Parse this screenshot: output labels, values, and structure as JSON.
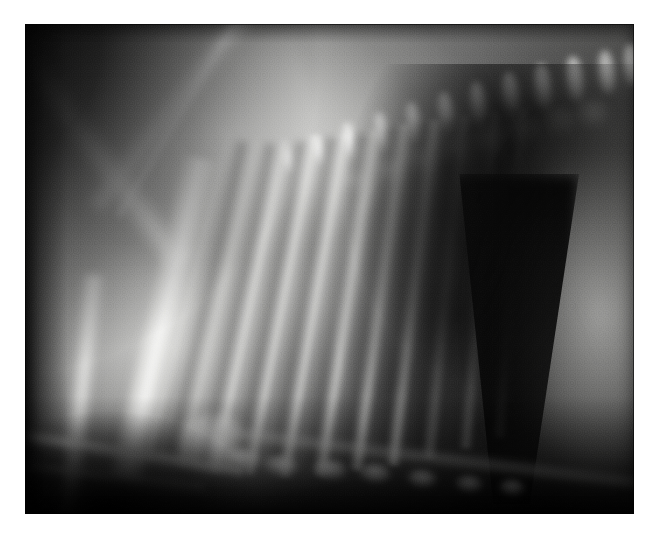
{
  "viewer": {
    "background_color": "#ffffff",
    "canvas_width": 657,
    "canvas_height": 540
  },
  "film": {
    "modality_label": "radiograph",
    "view_label": "lateral thoracic projection",
    "orientation_label": "cranial-left / dorsal-up",
    "plate_left": 25,
    "plate_top": 24,
    "plate_width": 609,
    "plate_height": 490,
    "border_color": "#ffffff",
    "film_base_color": "#0a0a0a",
    "bone_color": "#f6f6f4",
    "soft_tissue_color": "#a8a8a6",
    "gas_color": "#050505"
  },
  "anatomy": {
    "regions": [
      {
        "name": "cranial-thorax-soft-tissue",
        "density_label": "radiopaque",
        "note": "bright cranioventral mass, cranial-left"
      },
      {
        "name": "scapula",
        "density_label": "bone",
        "note": "oblique radiopaque band, cranio-dorsal"
      },
      {
        "name": "humerus",
        "density_label": "bone",
        "note": "long bright diaphysis sweeping caudoventrally"
      },
      {
        "name": "radius-ulna",
        "density_label": "bone",
        "note": "second long bone, ventro-cranial"
      },
      {
        "name": "thoracic-vertebrae",
        "density_label": "bone",
        "note": "oblique column rising caudo-dorsally"
      },
      {
        "name": "spinous-processes",
        "density_label": "bone",
        "note": "row of rounded dorsal projections"
      },
      {
        "name": "ribs",
        "density_label": "bone",
        "note": "fan of oblique striations across the thorax"
      },
      {
        "name": "caudodorsal-lung-field",
        "density_label": "gas",
        "note": "very radiolucent dark wedge"
      },
      {
        "name": "diaphragm",
        "density_label": "soft tissue",
        "note": "bright curved caudal border"
      },
      {
        "name": "cranial-abdomen-liver",
        "density_label": "soft tissue",
        "note": "bright field at far caudal edge"
      },
      {
        "name": "sternebrae",
        "density_label": "bone",
        "note": "small bright ovals along the ventral border"
      },
      {
        "name": "cardiac-silhouette",
        "density_label": "soft tissue",
        "note": "faint mid-ventral opacity"
      }
    ],
    "spinous_processes": [
      {
        "x": 316,
        "y": 98,
        "w": 17,
        "h": 40,
        "r": -9
      },
      {
        "x": 348,
        "y": 88,
        "w": 18,
        "h": 42,
        "r": -9
      },
      {
        "x": 380,
        "y": 78,
        "w": 18,
        "h": 43,
        "r": -8
      },
      {
        "x": 412,
        "y": 68,
        "w": 19,
        "h": 44,
        "r": -8
      },
      {
        "x": 444,
        "y": 58,
        "w": 19,
        "h": 45,
        "r": -7
      },
      {
        "x": 476,
        "y": 48,
        "w": 20,
        "h": 46,
        "r": -7
      },
      {
        "x": 508,
        "y": 40,
        "w": 20,
        "h": 46,
        "r": -6
      },
      {
        "x": 540,
        "y": 32,
        "w": 20,
        "h": 46,
        "r": -6
      },
      {
        "x": 572,
        "y": 26,
        "w": 19,
        "h": 44,
        "r": -5
      },
      {
        "x": 598,
        "y": 20,
        "w": 18,
        "h": 42,
        "r": -5
      },
      {
        "x": 286,
        "y": 110,
        "w": 16,
        "h": 36,
        "r": -10
      },
      {
        "x": 256,
        "y": 122,
        "w": 15,
        "h": 32,
        "r": -11
      }
    ],
    "vertebral_bodies": [
      {
        "x": 312,
        "y": 140,
        "w": 34,
        "h": 30
      },
      {
        "x": 346,
        "y": 130,
        "w": 34,
        "h": 30
      },
      {
        "x": 380,
        "y": 120,
        "w": 34,
        "h": 30
      },
      {
        "x": 414,
        "y": 110,
        "w": 34,
        "h": 30
      },
      {
        "x": 448,
        "y": 100,
        "w": 34,
        "h": 30
      },
      {
        "x": 482,
        "y": 90,
        "w": 34,
        "h": 30
      },
      {
        "x": 516,
        "y": 82,
        "w": 34,
        "h": 30
      },
      {
        "x": 550,
        "y": 74,
        "w": 34,
        "h": 30
      }
    ],
    "ribs": [
      {
        "x": 196,
        "y": 110,
        "w": 15,
        "h": 330,
        "r": 14,
        "faint": true
      },
      {
        "x": 224,
        "y": 116,
        "w": 15,
        "h": 335,
        "r": 13,
        "faint": true
      },
      {
        "x": 252,
        "y": 116,
        "w": 16,
        "h": 340,
        "r": 12,
        "faint": false
      },
      {
        "x": 282,
        "y": 112,
        "w": 16,
        "h": 345,
        "r": 11,
        "faint": false
      },
      {
        "x": 312,
        "y": 110,
        "w": 16,
        "h": 348,
        "r": 10,
        "faint": false
      },
      {
        "x": 342,
        "y": 106,
        "w": 17,
        "h": 350,
        "r": 9,
        "faint": false
      },
      {
        "x": 372,
        "y": 100,
        "w": 17,
        "h": 350,
        "r": 8,
        "faint": false
      },
      {
        "x": 402,
        "y": 96,
        "w": 17,
        "h": 348,
        "r": 7,
        "faint": false
      },
      {
        "x": 432,
        "y": 92,
        "w": 16,
        "h": 344,
        "r": 6,
        "faint": true
      },
      {
        "x": 462,
        "y": 88,
        "w": 16,
        "h": 338,
        "r": 5,
        "faint": true
      },
      {
        "x": 490,
        "y": 84,
        "w": 15,
        "h": 330,
        "r": 4,
        "faint": true
      }
    ],
    "interspaces": [
      {
        "x": 210,
        "y": 118,
        "w": 16,
        "h": 320,
        "r": 13
      },
      {
        "x": 238,
        "y": 120,
        "w": 16,
        "h": 326,
        "r": 12
      },
      {
        "x": 268,
        "y": 118,
        "w": 17,
        "h": 330,
        "r": 11
      },
      {
        "x": 298,
        "y": 114,
        "w": 17,
        "h": 334,
        "r": 10
      },
      {
        "x": 328,
        "y": 110,
        "w": 18,
        "h": 336,
        "r": 9
      },
      {
        "x": 358,
        "y": 104,
        "w": 18,
        "h": 336,
        "r": 8
      },
      {
        "x": 388,
        "y": 100,
        "w": 18,
        "h": 334,
        "r": 7
      },
      {
        "x": 418,
        "y": 96,
        "w": 17,
        "h": 330,
        "r": 6
      }
    ],
    "sternebrae": [
      {
        "x": 196,
        "y": 424,
        "w": 40,
        "h": 22,
        "r": 8
      },
      {
        "x": 238,
        "y": 432,
        "w": 36,
        "h": 20,
        "r": 8
      },
      {
        "x": 288,
        "y": 436,
        "w": 34,
        "h": 20,
        "r": 7
      },
      {
        "x": 334,
        "y": 440,
        "w": 32,
        "h": 19,
        "r": 6
      },
      {
        "x": 382,
        "y": 446,
        "w": 30,
        "h": 18,
        "r": 6
      },
      {
        "x": 430,
        "y": 452,
        "w": 28,
        "h": 17,
        "r": 5
      },
      {
        "x": 474,
        "y": 456,
        "w": 26,
        "h": 16,
        "r": 4
      }
    ]
  }
}
